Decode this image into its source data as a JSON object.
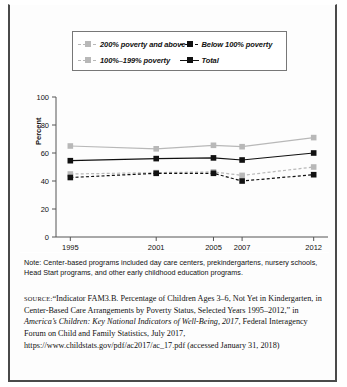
{
  "chart_data": {
    "type": "line",
    "title": "",
    "xlabel": "",
    "ylabel": "Percent",
    "categories": [
      "1995",
      "2001",
      "2005",
      "2007",
      "2012"
    ],
    "x_values": [
      1995,
      2001,
      2005,
      2007,
      2012
    ],
    "xlim": [
      1994,
      2013
    ],
    "ylim": [
      0,
      100
    ],
    "yticks": [
      0,
      20,
      40,
      60,
      80,
      100
    ],
    "grid": false,
    "legend_position": "top",
    "series": [
      {
        "name": "200% poverty and above",
        "values": [
          65,
          63,
          65.5,
          64.5,
          71
        ],
        "color": "#b8b8b8",
        "line_style": "solid",
        "marker": "square"
      },
      {
        "name": "100%–199% poverty",
        "values": [
          45,
          46,
          46.5,
          44,
          50
        ],
        "color": "#b8b8b8",
        "line_style": "dashed",
        "marker": "square"
      },
      {
        "name": "Below 100% poverty",
        "values": [
          42.5,
          45.5,
          45.5,
          40,
          44.5
        ],
        "color": "#111111",
        "line_style": "dashed",
        "marker": "square"
      },
      {
        "name": "Total",
        "values": [
          54.5,
          56,
          56.5,
          55,
          60
        ],
        "color": "#111111",
        "line_style": "solid",
        "marker": "square"
      }
    ]
  },
  "legend": {
    "entries": [
      {
        "label": "200% poverty and above"
      },
      {
        "label": "Below 100% poverty"
      },
      {
        "label": "100%–199% poverty"
      },
      {
        "label": "Total"
      }
    ]
  },
  "notes": {
    "note_text": "Note: Center-based programs included day care centers, prekindergartens, nursery schools, Head Start programs, and other early childhood education programs."
  },
  "source": {
    "label": "SOURCE:",
    "part1": "“Indicator FAM3.B. Percentage of Children Ages 3–6, Not Yet in Kindergarten, in Center-Based Care Arrangements by Poverty Status, Selected Years 1995–2012,” in ",
    "italic1": "America’s Children: Key National Indicators of Well-Being, 2017",
    "part2": ", Federal Interagency Forum on Child and Family Statistics, July 2017, https://www.childstats.gov/pdf/ac2017/ac_17.pdf (accessed January 31, 2018)"
  }
}
